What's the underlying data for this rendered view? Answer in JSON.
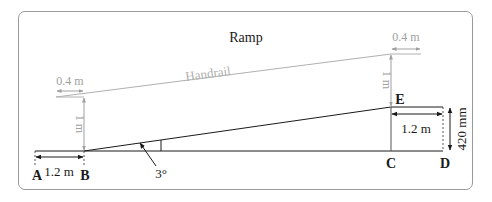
{
  "title": "Ramp",
  "handrail_label": "Handrail",
  "points": {
    "A": "A",
    "B": "B",
    "C": "C",
    "D": "D",
    "E": "E"
  },
  "dimensions": {
    "handrail_extension_left": "0.4 m",
    "handrail_extension_right": "0.4 m",
    "handrail_height_left": "1 m",
    "handrail_height_right": "1 m",
    "landing_bottom": "1.2 m",
    "landing_top": "1.2 m",
    "rise": "420 mm",
    "angle": "3°"
  },
  "colors": {
    "line": "#1a1a1a",
    "handrail": "#b0b0b0",
    "dimension_gray": "#a0a0a0",
    "frame": "#9a9a9a"
  }
}
